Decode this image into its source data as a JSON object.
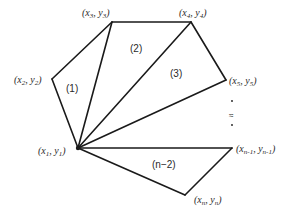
{
  "diagram": {
    "type": "polygon-triangulation",
    "vertices": [
      {
        "id": "p1",
        "var": "x",
        "sub": "1",
        "var2": "y",
        "sub2": "1",
        "x": 78,
        "y": 148
      },
      {
        "id": "p2",
        "var": "x",
        "sub": "2",
        "var2": "y",
        "sub2": "2",
        "x": 52,
        "y": 79
      },
      {
        "id": "p3",
        "var": "x",
        "sub": "3",
        "var2": "y",
        "sub2": "3",
        "x": 112,
        "y": 22
      },
      {
        "id": "p4",
        "var": "x",
        "sub": "4",
        "var2": "y",
        "sub2": "4",
        "x": 191,
        "y": 22
      },
      {
        "id": "p5",
        "var": "x",
        "sub": "5",
        "var2": "y",
        "sub2": "5",
        "x": 226,
        "y": 80
      },
      {
        "id": "pn1",
        "var": "x",
        "sub": "n-1",
        "var2": "y",
        "sub2": "n-1",
        "x": 232,
        "y": 148
      },
      {
        "id": "pn",
        "var": "x",
        "sub": "n",
        "var2": "y",
        "sub2": "n",
        "x": 185,
        "y": 195
      }
    ],
    "labels": {
      "p1": {
        "open": "(",
        "x": "x",
        "xs": "1",
        "comma": ", ",
        "y": "y",
        "ys": "1",
        "close": ")"
      },
      "p2": {
        "open": "(",
        "x": "x",
        "xs": "2",
        "comma": ", ",
        "y": "y",
        "ys": "2",
        "close": ")"
      },
      "p3": {
        "open": "(",
        "x": "x",
        "xs": "3",
        "comma": ", ",
        "y": "y",
        "ys": "3",
        "close": ")"
      },
      "p4": {
        "open": "(",
        "x": "x",
        "xs": "4",
        "comma": ", ",
        "y": "y",
        "ys": "4",
        "close": ")"
      },
      "p5": {
        "open": "(",
        "x": "x",
        "xs": "5",
        "comma": ", ",
        "y": "y",
        "ys": "5",
        "close": ")"
      },
      "pn1": {
        "open": "(",
        "x": "x",
        "xs": "n-1",
        "comma": ", ",
        "y": "y",
        "ys": "n-1",
        "close": ")"
      },
      "pn": {
        "open": "(",
        "x": "x",
        "xs": "n",
        "comma": ", ",
        "y": "y",
        "ys": "n",
        "close": ")"
      }
    },
    "regions": [
      {
        "id": "r1",
        "label": "(1)"
      },
      {
        "id": "r2",
        "label": "(2)"
      },
      {
        "id": "r3",
        "label": "(3)"
      },
      {
        "id": "rn2",
        "label": "(n−2)"
      }
    ],
    "ellipsis": {
      "approx_symbol": "≈",
      "dots": "· ·"
    },
    "colors": {
      "line": "#1a1a1a",
      "text": "#2a2a2a",
      "background": "#ffffff"
    }
  }
}
